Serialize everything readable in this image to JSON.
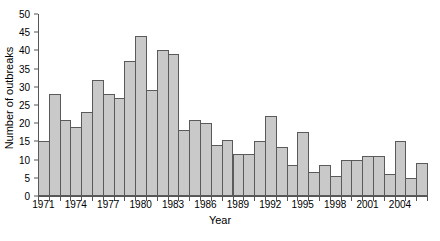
{
  "chart_data": {
    "type": "bar",
    "title": "",
    "subtitle": "",
    "xlabel": "Year",
    "ylabel": "Number of outbreaks",
    "categories": [
      "1971",
      "1972",
      "1973",
      "1974",
      "1975",
      "1976",
      "1977",
      "1978",
      "1979",
      "1980",
      "1981",
      "1982",
      "1983",
      "1984",
      "1985",
      "1986",
      "1987",
      "1988",
      "1989",
      "1990",
      "1991",
      "1992",
      "1993",
      "1994",
      "1995",
      "1996",
      "1997",
      "1998",
      "1999",
      "2000",
      "2001",
      "2002",
      "2003",
      "2004",
      "2005",
      "2006"
    ],
    "values": [
      15,
      28,
      21,
      19,
      23,
      32,
      28,
      27,
      37,
      44,
      29,
      40,
      39,
      18,
      21,
      20,
      14,
      15.5,
      11.5,
      11.5,
      15,
      22,
      13.5,
      8.5,
      17.5,
      6.5,
      8.5,
      5.5,
      10,
      10,
      11,
      11,
      6,
      15,
      5,
      9
    ],
    "xlim": [
      1971,
      2007
    ],
    "ylim": [
      0,
      50
    ],
    "ytick_values": [
      0,
      5,
      10,
      15,
      20,
      25,
      30,
      35,
      40,
      45,
      50
    ],
    "ytick_labels": [
      "0",
      "5",
      "10",
      "15",
      "20",
      "25",
      "30",
      "35",
      "40",
      "45",
      "50"
    ],
    "xtick_labels": [
      "1971",
      "1974",
      "1977",
      "1980",
      "1983",
      "1986",
      "1989",
      "1992",
      "1995",
      "1998",
      "2001",
      "2004"
    ],
    "xtick_label_years": [
      1971,
      1974,
      1977,
      1980,
      1983,
      1986,
      1989,
      1992,
      1995,
      1998,
      2001,
      2004
    ],
    "grid": false,
    "legend": false,
    "legend_position": "none",
    "bar_fill_color": "#c9c9c9",
    "bar_edge_color": "#5a5a5a",
    "axis_color": "#555555",
    "text_color": "#000000",
    "background_color": "#ffffff"
  },
  "layout": {
    "plot_left": 38,
    "plot_right": 427,
    "plot_top": 14,
    "plot_bottom": 196,
    "ylabel_left": 4,
    "xlabel_top": 214,
    "xtick_label_top": 199
  }
}
